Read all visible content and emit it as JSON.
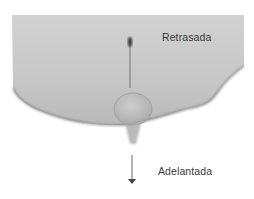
{
  "figure": {
    "labels": {
      "top": "Retrasada",
      "bottom": "Adelantada"
    },
    "colors": {
      "skin": "#c4c4c4",
      "shadow": "#8a8a8a",
      "arrow": "#555555",
      "text": "#3a3a3a"
    }
  }
}
